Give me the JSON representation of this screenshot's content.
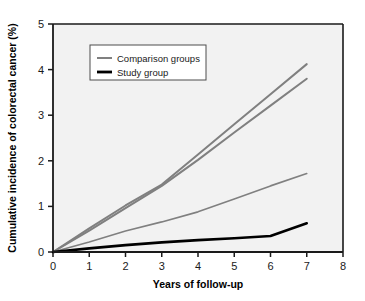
{
  "chart_data": {
    "type": "line",
    "title": "",
    "xlabel": "Years of follow-up",
    "ylabel": "Cumulative incidence of colorectal cancer (%)",
    "xlim": [
      0,
      8
    ],
    "ylim": [
      0,
      5
    ],
    "xticks": [
      "0",
      "1",
      "2",
      "3",
      "4",
      "5",
      "6",
      "7",
      "8"
    ],
    "yticks": [
      "0",
      "1",
      "2",
      "3",
      "4",
      "5"
    ],
    "grid": false,
    "legend_position": "upper-left-inside",
    "x": [
      0,
      1,
      2,
      3,
      4,
      5,
      6,
      7
    ],
    "series": [
      {
        "name": "Comparison group A",
        "legend_key": "Comparison groups",
        "color": "#808080",
        "width": 2.0,
        "values": [
          0.0,
          0.52,
          1.02,
          1.48,
          2.14,
          2.8,
          3.46,
          4.12
        ]
      },
      {
        "name": "Comparison group B",
        "legend_key": "Comparison groups",
        "color": "#808080",
        "width": 2.0,
        "values": [
          0.0,
          0.47,
          0.96,
          1.45,
          2.02,
          2.62,
          3.21,
          3.8
        ]
      },
      {
        "name": "Comparison group C",
        "legend_key": "Comparison groups",
        "color": "#808080",
        "width": 1.6,
        "values": [
          0.0,
          0.22,
          0.46,
          0.66,
          0.88,
          1.16,
          1.45,
          1.72
        ]
      },
      {
        "name": "Study group",
        "legend_key": "Study group",
        "color": "#000000",
        "width": 2.6,
        "values": [
          0.0,
          0.08,
          0.15,
          0.21,
          0.26,
          0.3,
          0.35,
          0.63
        ]
      }
    ],
    "legend": [
      {
        "label": "Comparison groups",
        "color": "#808080",
        "width": 2.0
      },
      {
        "label": "Study group",
        "color": "#000000",
        "width": 2.8
      }
    ],
    "colors": {
      "plot_background": "#f2f2f2",
      "frame": "#1a1a1a",
      "comparison": "#808080",
      "study": "#000000",
      "legend_background": "#ffffff",
      "legend_border": "#4d4d4d"
    }
  }
}
